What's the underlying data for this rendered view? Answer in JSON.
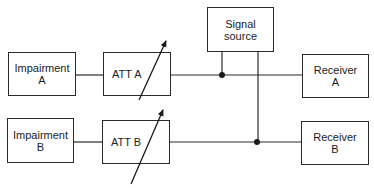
{
  "diagram": {
    "type": "block-diagram",
    "blocks": {
      "impairment_a": {
        "line1": "Impairment",
        "line2": "A"
      },
      "impairment_b": {
        "line1": "Impairment",
        "line2": "B"
      },
      "att_a": {
        "label": "ATT A"
      },
      "att_b": {
        "label": "ATT B"
      },
      "signal_source": {
        "line1": "Signal",
        "line2": "source"
      },
      "receiver_a": {
        "line1": "Receiver",
        "line2": "A"
      },
      "receiver_b": {
        "line1": "Receiver",
        "line2": "B"
      }
    },
    "connections": [
      {
        "from": "Impairment A",
        "to": "ATT A"
      },
      {
        "from": "ATT A",
        "to": "Receiver A"
      },
      {
        "from": "Impairment B",
        "to": "ATT B"
      },
      {
        "from": "ATT B",
        "to": "Receiver B"
      },
      {
        "from": "Signal source",
        "to": "junction A (ATT A → Receiver A line)"
      },
      {
        "from": "Signal source",
        "to": "junction B (ATT B → Receiver B line)"
      }
    ],
    "colors": {
      "line": "#2a2a2a",
      "background": "#ffffff"
    }
  }
}
